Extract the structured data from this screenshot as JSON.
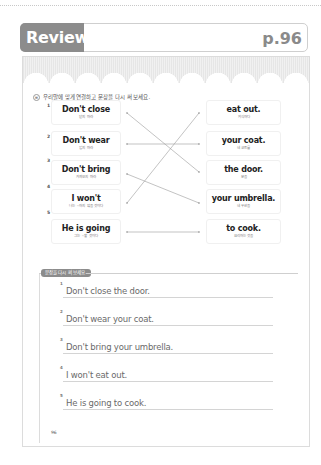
{
  "header": {
    "badge": "Review",
    "page_ref": "p.96"
  },
  "exercise": {
    "instruction_icon": "list-icon",
    "instruction": "우리말에 맞게 연결하고 문장을 다시 써 보세요.",
    "left_items": [
      {
        "num": "1",
        "en": "Don't close",
        "ko": "닫지 마라"
      },
      {
        "num": "2",
        "en": "Don't wear",
        "ko": "입지 마라"
      },
      {
        "num": "3",
        "en": "Don't bring",
        "ko": "가져오지 마라"
      },
      {
        "num": "4",
        "en": "I won't",
        "ko": "나는 ~하지 않을 것이다"
      },
      {
        "num": "5",
        "en": "He is going",
        "ko": "그는 ~할 것이다"
      }
    ],
    "right_items": [
      {
        "en": "eat out.",
        "ko": "외식하다"
      },
      {
        "en": "your coat.",
        "ko": "네 코트를"
      },
      {
        "en": "the door.",
        "ko": "문을"
      },
      {
        "en": "your umbrella.",
        "ko": "네 우산을"
      },
      {
        "en": "to cook.",
        "ko": "요리하는 것을"
      }
    ],
    "connections": [
      {
        "from": 1,
        "to": 3
      },
      {
        "from": 2,
        "to": 2
      },
      {
        "from": 3,
        "to": 4
      },
      {
        "from": 4,
        "to": 1
      },
      {
        "from": 5,
        "to": 5
      }
    ]
  },
  "rewrite": {
    "label": "문장을 다시 써 보세요.",
    "answers": [
      {
        "num": "1",
        "text": "Don't close the door."
      },
      {
        "num": "2",
        "text": "Don't wear your coat."
      },
      {
        "num": "3",
        "text": "Don't bring your umbrella."
      },
      {
        "num": "4",
        "text": "I won't eat out."
      },
      {
        "num": "5",
        "text": "He is going to cook."
      }
    ]
  },
  "footer": {
    "page_number": "96"
  },
  "colors": {
    "badge_gray": "#8c8c8c",
    "line_gray": "#9a9a9a",
    "answer_text": "#6a6a6a"
  }
}
